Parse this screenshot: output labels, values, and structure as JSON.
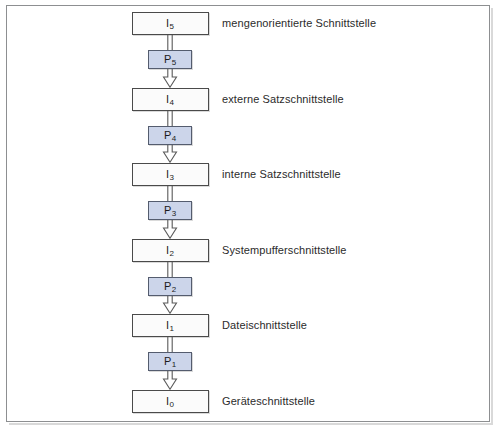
{
  "diagram": {
    "orientation": "vertical-top-down",
    "colors": {
      "frame_border": "#8d8f91",
      "interface_fill": "#fbfbfb",
      "interface_border": "#4a4a4a",
      "process_fill": "#ccd5ea",
      "process_border": "#545c6e",
      "connector_stroke": "#5a5a5a",
      "text": "#2b2b2b",
      "page_background": "#ffffff"
    },
    "interfaces": [
      {
        "id": "I5",
        "symbol": "I",
        "index": "5",
        "caption": "mengenorientierte Schnittstelle"
      },
      {
        "id": "I4",
        "symbol": "I",
        "index": "4",
        "caption": "externe Satzschnittstelle"
      },
      {
        "id": "I3",
        "symbol": "I",
        "index": "3",
        "caption": "interne Satzschnittstelle"
      },
      {
        "id": "I2",
        "symbol": "I",
        "index": "2",
        "caption": "Systempufferschnittstelle"
      },
      {
        "id": "I1",
        "symbol": "I",
        "index": "1",
        "caption": "Dateischnittstelle"
      },
      {
        "id": "I0",
        "symbol": "I",
        "index": "0",
        "caption": "Geräteschnittstelle"
      }
    ],
    "processes": [
      {
        "id": "P5",
        "symbol": "P",
        "index": "5"
      },
      {
        "id": "P4",
        "symbol": "P",
        "index": "4"
      },
      {
        "id": "P3",
        "symbol": "P",
        "index": "3"
      },
      {
        "id": "P2",
        "symbol": "P",
        "index": "2"
      },
      {
        "id": "P1",
        "symbol": "P",
        "index": "1"
      }
    ],
    "connector_icon": "hollow-down-arrow-icon"
  }
}
